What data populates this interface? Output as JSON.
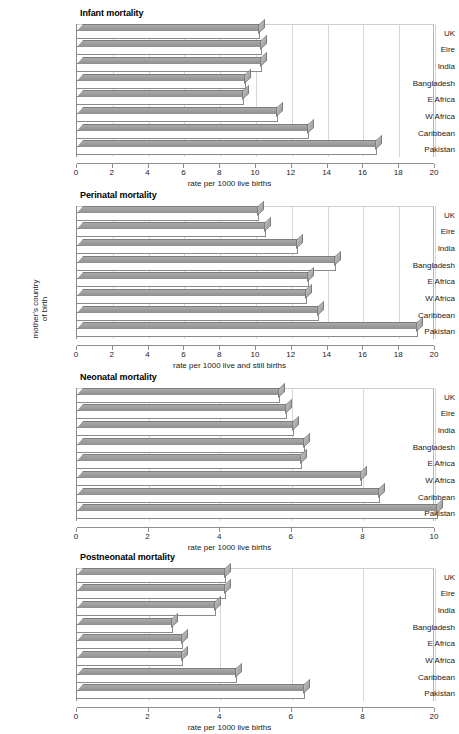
{
  "figure": {
    "ylabel": "mother's country\nof birth",
    "categories": [
      "UK",
      "Eire",
      "India",
      "Bangladesh",
      "E Africa",
      "W Africa",
      "Caribbean",
      "Pakistan"
    ]
  },
  "chart_data": [
    {
      "type": "bar",
      "orientation": "horizontal",
      "title": "Infant mortality",
      "xlabel": "rate per 1000 live births",
      "ylabel": "mother's country of birth",
      "categories": [
        "UK",
        "Eire",
        "India",
        "Bangladesh",
        "E Africa",
        "W Africa",
        "Caribbean",
        "Pakistan"
      ],
      "values": [
        10.3,
        10.4,
        10.4,
        9.5,
        9.4,
        11.3,
        13.0,
        16.8
      ],
      "xlim": [
        0,
        20
      ],
      "xticks": [
        0,
        2,
        4,
        6,
        8,
        10,
        12,
        14,
        16,
        18,
        20
      ],
      "xticklabels": [
        "0",
        "2",
        "4",
        "6",
        "8",
        "10",
        "12",
        "14",
        "16",
        "18",
        "20"
      ],
      "grid": true,
      "legend": "none"
    },
    {
      "type": "bar",
      "orientation": "horizontal",
      "title": "Perinatal mortality",
      "xlabel": "rate per 1000 live and still births",
      "ylabel": "mother's country of birth",
      "categories": [
        "UK",
        "Eire",
        "India",
        "Bangladesh",
        "E Africa",
        "W Africa",
        "Caribbean",
        "Pakistan"
      ],
      "values": [
        10.2,
        10.6,
        12.4,
        14.5,
        13.0,
        12.9,
        13.6,
        19.1
      ],
      "xlim": [
        0,
        20
      ],
      "xticks": [
        0,
        2,
        4,
        6,
        8,
        10,
        12,
        14,
        16,
        18,
        20
      ],
      "xticklabels": [
        "0",
        "2",
        "4",
        "6",
        "8",
        "10",
        "12",
        "14",
        "16",
        "18",
        "20"
      ],
      "grid": true,
      "legend": "none"
    },
    {
      "type": "bar",
      "orientation": "horizontal",
      "title": "Neonatal mortality",
      "xlabel": "rate per 1000 live births",
      "ylabel": "mother's country of birth",
      "categories": [
        "UK",
        "Eire",
        "India",
        "Bangladesh",
        "E Africa",
        "W Africa",
        "Caribbean",
        "Pakistan"
      ],
      "values": [
        5.7,
        5.9,
        6.1,
        6.4,
        6.3,
        8.0,
        8.5,
        10.1
      ],
      "xlim": [
        0,
        10
      ],
      "xticks": [
        0,
        2,
        4,
        6,
        8,
        10
      ],
      "xticklabels": [
        "0",
        "2",
        "4",
        "6",
        "8",
        "10"
      ],
      "grid": true,
      "legend": "none"
    },
    {
      "type": "bar",
      "orientation": "horizontal",
      "title": "Postneonatal mortality",
      "xlabel": "rate per 1000 live births",
      "ylabel": "mother's country of birth",
      "categories": [
        "UK",
        "Eire",
        "India",
        "Bangladesh",
        "E Africa",
        "W Africa",
        "Caribbean",
        "Pakistan"
      ],
      "values": [
        4.2,
        4.2,
        3.9,
        2.7,
        3.0,
        3.0,
        4.5,
        6.4
      ],
      "xlim": [
        0,
        10
      ],
      "xticks": [
        0,
        2,
        4,
        6,
        8,
        10
      ],
      "xticklabels": [
        "0",
        "2",
        "4",
        "6",
        "8",
        "20"
      ],
      "grid": true,
      "legend": "none"
    }
  ],
  "style": {
    "bar_top_color": "#9a9a9a",
    "bar_front_color": "#ffffff",
    "bar_edge_color": "#8a8a8a",
    "grid_color": "#d6d6d6",
    "axis_color": "#8d8d8d",
    "text_color": "#1a1a1a"
  }
}
